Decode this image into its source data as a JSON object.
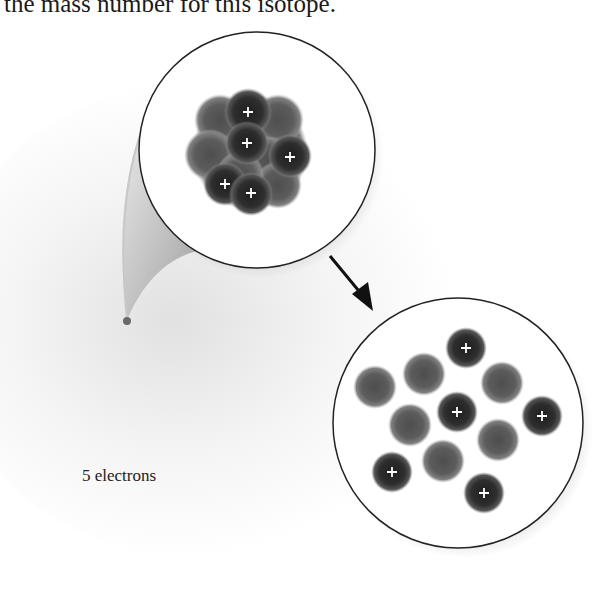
{
  "header": {
    "text": "the mass number for this isotope."
  },
  "atom": {
    "electron_label": "5 electrons",
    "electron_count": 5
  },
  "nucleus_zoom": {
    "description": "Compact nucleus",
    "protons": 5,
    "neutrons": 6,
    "proton_symbol": "+"
  },
  "nucleus_expanded": {
    "description": "Expanded nucleons",
    "protons": 5,
    "neutrons": 6,
    "proton_symbol": "+"
  },
  "colors": {
    "proton": "#2a2a2a",
    "neutron": "#5a5a5a",
    "outline": "#222222",
    "plus": "#ffffff"
  }
}
